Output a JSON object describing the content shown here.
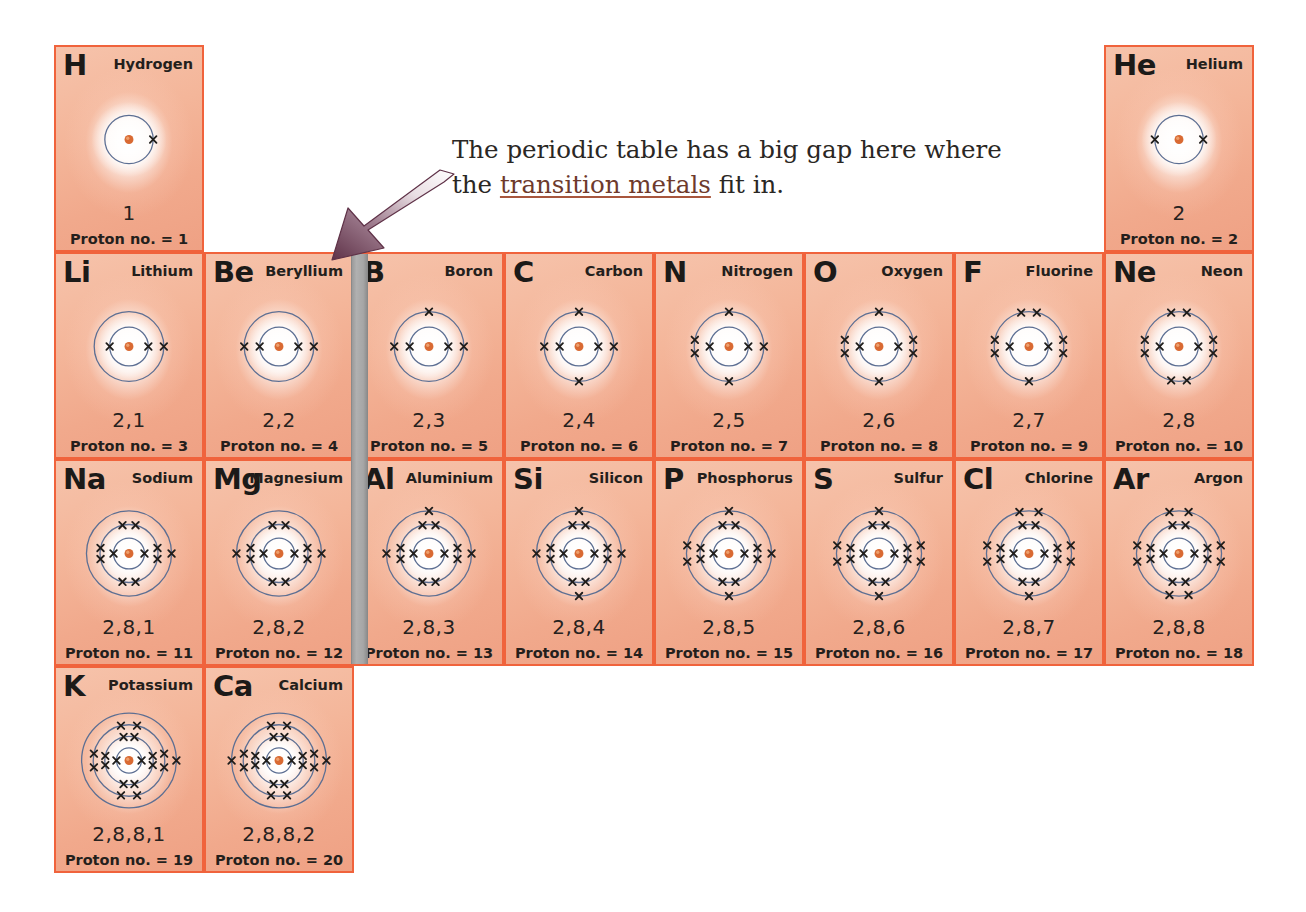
{
  "figure": {
    "type": "periodic-table-electron-shells"
  },
  "annotation": {
    "text_before": "The periodic table has a big gap here where the ",
    "link_text": "transition metals",
    "text_after": " fit in.",
    "line1": "The periodic table has a big gap here where",
    "line2_before": "the ",
    "line2_link": "transition metals",
    "line2_after": " fit in."
  },
  "labels": {
    "proton_prefix": "Proton no. =  "
  },
  "colors": {
    "cell_border": "#f0633c",
    "cell_fill": "#f2ad90",
    "nucleus": "#d96a33",
    "shell_line": "#5d6f93",
    "electron": "#1f1d1b",
    "gap_bar": "#a6a6a6",
    "arrow": "#5f3248",
    "link": "#6e3a2c",
    "text": "#241f1c"
  },
  "layout": {
    "grid_left": 54,
    "grid_top": 45,
    "col_width": 150,
    "row_height": 207,
    "gap_bar_left": 351,
    "gap_bar_width": 15
  },
  "elements": [
    {
      "symbol": "H",
      "name": "Hydrogen",
      "config": "1",
      "proton_no": "1",
      "shells": [
        1
      ],
      "col": 0,
      "row": 0
    },
    {
      "symbol": "He",
      "name": "Helium",
      "config": "2",
      "proton_no": "2",
      "shells": [
        2
      ],
      "col": 7,
      "row": 0
    },
    {
      "symbol": "Li",
      "name": "Lithium",
      "config": "2,1",
      "proton_no": "3",
      "shells": [
        2,
        1
      ],
      "col": 0,
      "row": 1
    },
    {
      "symbol": "Be",
      "name": "Beryllium",
      "config": "2,2",
      "proton_no": "4",
      "shells": [
        2,
        2
      ],
      "col": 1,
      "row": 1
    },
    {
      "symbol": "B",
      "name": "Boron",
      "config": "2,3",
      "proton_no": "5",
      "shells": [
        2,
        3
      ],
      "col": 2,
      "row": 1
    },
    {
      "symbol": "C",
      "name": "Carbon",
      "config": "2,4",
      "proton_no": "6",
      "shells": [
        2,
        4
      ],
      "col": 3,
      "row": 1
    },
    {
      "symbol": "N",
      "name": "Nitrogen",
      "config": "2,5",
      "proton_no": "7",
      "shells": [
        2,
        5
      ],
      "col": 4,
      "row": 1
    },
    {
      "symbol": "O",
      "name": "Oxygen",
      "config": "2,6",
      "proton_no": "8",
      "shells": [
        2,
        6
      ],
      "col": 5,
      "row": 1
    },
    {
      "symbol": "F",
      "name": "Fluorine",
      "config": "2,7",
      "proton_no": "9",
      "shells": [
        2,
        7
      ],
      "col": 6,
      "row": 1
    },
    {
      "symbol": "Ne",
      "name": "Neon",
      "config": "2,8",
      "proton_no": "10",
      "shells": [
        2,
        8
      ],
      "col": 7,
      "row": 1
    },
    {
      "symbol": "Na",
      "name": "Sodium",
      "config": "2,8,1",
      "proton_no": "11",
      "shells": [
        2,
        8,
        1
      ],
      "col": 0,
      "row": 2
    },
    {
      "symbol": "Mg",
      "name": "Magnesium",
      "config": "2,8,2",
      "proton_no": "12",
      "shells": [
        2,
        8,
        2
      ],
      "col": 1,
      "row": 2
    },
    {
      "symbol": "Al",
      "name": "Aluminium",
      "config": "2,8,3",
      "proton_no": "13",
      "shells": [
        2,
        8,
        3
      ],
      "col": 2,
      "row": 2
    },
    {
      "symbol": "Si",
      "name": "Silicon",
      "config": "2,8,4",
      "proton_no": "14",
      "shells": [
        2,
        8,
        4
      ],
      "col": 3,
      "row": 2
    },
    {
      "symbol": "P",
      "name": "Phosphorus",
      "config": "2,8,5",
      "proton_no": "15",
      "shells": [
        2,
        8,
        5
      ],
      "col": 4,
      "row": 2
    },
    {
      "symbol": "S",
      "name": "Sulfur",
      "config": "2,8,6",
      "proton_no": "16",
      "shells": [
        2,
        8,
        6
      ],
      "col": 5,
      "row": 2
    },
    {
      "symbol": "Cl",
      "name": "Chlorine",
      "config": "2,8,7",
      "proton_no": "17",
      "shells": [
        2,
        8,
        7
      ],
      "col": 6,
      "row": 2
    },
    {
      "symbol": "Ar",
      "name": "Argon",
      "config": "2,8,8",
      "proton_no": "18",
      "shells": [
        2,
        8,
        8
      ],
      "col": 7,
      "row": 2
    },
    {
      "symbol": "K",
      "name": "Potassium",
      "config": "2,8,8,1",
      "proton_no": "19",
      "shells": [
        2,
        8,
        8,
        1
      ],
      "col": 0,
      "row": 3
    },
    {
      "symbol": "Ca",
      "name": "Calcium",
      "config": "2,8,8,2",
      "proton_no": "20",
      "shells": [
        2,
        8,
        8,
        2
      ],
      "col": 1,
      "row": 3
    }
  ]
}
